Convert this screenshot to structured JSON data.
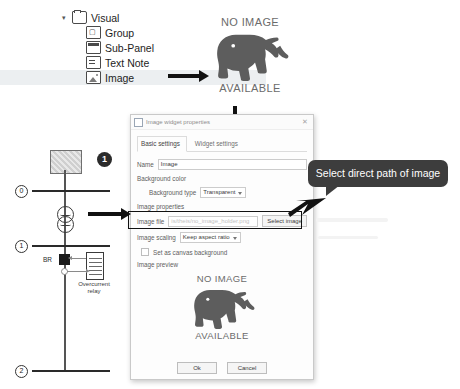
{
  "tree": {
    "root": {
      "label": "Visual",
      "icon": "folder-icon",
      "caret": "▾"
    },
    "items": [
      {
        "label": "Group",
        "icon": "group-icon"
      },
      {
        "label": "Sub-Panel",
        "icon": "sub-panel-icon"
      },
      {
        "label": "Text Note",
        "icon": "text-note-icon"
      },
      {
        "label": "Image",
        "icon": "image-icon",
        "selected": true
      }
    ]
  },
  "placeholder_top": {
    "line1": "NO IMAGE",
    "line2": "AVAILABLE",
    "icon": "elephant-icon"
  },
  "dialog": {
    "title": "Image widget properties",
    "title_icon": "image-widget-icon",
    "close_label": "✕",
    "tabs": [
      {
        "label": "Basic settings",
        "active": true
      },
      {
        "label": "Widget settings",
        "active": false
      }
    ],
    "name": {
      "label": "Name",
      "value": "Image"
    },
    "background": {
      "section_label": "Background color",
      "type_label": "Background type",
      "type_value": "Transparent"
    },
    "image_properties": {
      "section_label": "Image properties",
      "file_label": "Image file",
      "file_placeholder": "is/theis/no_image_holder.png",
      "select_button": "Select image",
      "scaling_label": "Image scaling",
      "scaling_value": "Keep aspect ratio",
      "canvas_background_label": "Set as canvas background",
      "canvas_background_checked": false,
      "preview_label": "Image preview"
    },
    "preview": {
      "line1": "NO IMAGE",
      "line2": "AVAILABLE",
      "icon": "elephant-icon"
    },
    "footer": {
      "ok": "Ok",
      "cancel": "Cancel"
    }
  },
  "callout": {
    "text": "Select direct path of image"
  },
  "diagram": {
    "badge": "1",
    "buses": [
      {
        "id": "0",
        "label": "0"
      },
      {
        "id": "1",
        "label": "1"
      },
      {
        "id": "2",
        "label": "2"
      }
    ],
    "breaker_label": "BR",
    "relay_label": "Overcurrent relay",
    "source_icon": "generator-icon",
    "transformer_icon": "transformer-icon"
  }
}
